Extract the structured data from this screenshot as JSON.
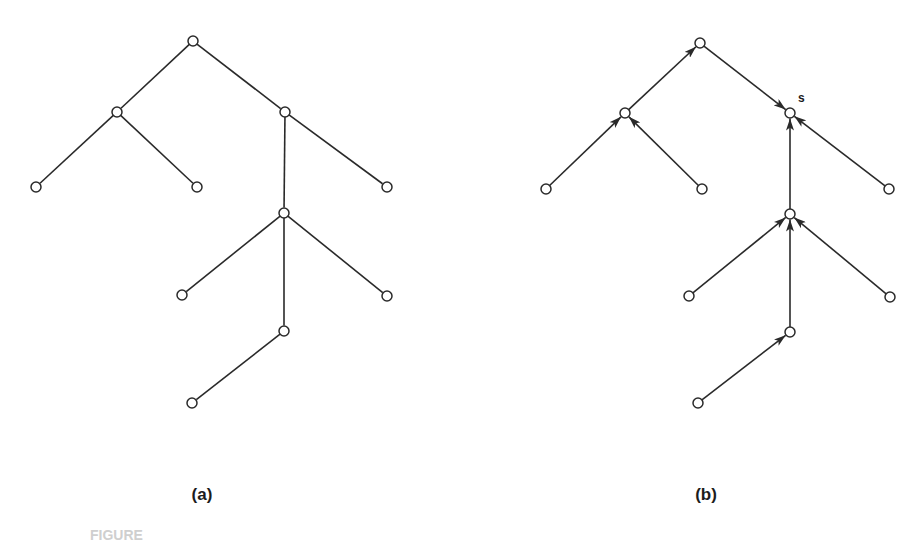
{
  "figure": {
    "panels": [
      {
        "id": "a",
        "label": "(a)",
        "label_pos": [
          202,
          485
        ],
        "directed": false,
        "nodes": [
          {
            "id": "r",
            "x": 193,
            "y": 41
          },
          {
            "id": "L",
            "x": 117,
            "y": 112
          },
          {
            "id": "R",
            "x": 285,
            "y": 112
          },
          {
            "id": "LL",
            "x": 36,
            "y": 187
          },
          {
            "id": "LR",
            "x": 197,
            "y": 187
          },
          {
            "id": "RR",
            "x": 387,
            "y": 187
          },
          {
            "id": "M",
            "x": 284,
            "y": 213
          },
          {
            "id": "ML",
            "x": 182,
            "y": 295
          },
          {
            "id": "MR",
            "x": 387,
            "y": 296
          },
          {
            "id": "D",
            "x": 284,
            "y": 331
          },
          {
            "id": "DL",
            "x": 192,
            "y": 403
          }
        ],
        "edges": [
          [
            "r",
            "L"
          ],
          [
            "r",
            "R"
          ],
          [
            "L",
            "LL"
          ],
          [
            "L",
            "LR"
          ],
          [
            "R",
            "RR"
          ],
          [
            "R",
            "M"
          ],
          [
            "M",
            "ML"
          ],
          [
            "M",
            "MR"
          ],
          [
            "M",
            "D"
          ],
          [
            "D",
            "DL"
          ]
        ]
      },
      {
        "id": "b",
        "label": "(b)",
        "label_pos": [
          706,
          485
        ],
        "directed": true,
        "special_node": {
          "id": "S",
          "label": "s",
          "label_offset": [
            12,
            -16
          ]
        },
        "nodes": [
          {
            "id": "r",
            "x": 700,
            "y": 43
          },
          {
            "id": "L",
            "x": 625,
            "y": 113
          },
          {
            "id": "S",
            "x": 790,
            "y": 113
          },
          {
            "id": "LL",
            "x": 546,
            "y": 189
          },
          {
            "id": "LR",
            "x": 702,
            "y": 189
          },
          {
            "id": "RR",
            "x": 889,
            "y": 189
          },
          {
            "id": "M",
            "x": 790,
            "y": 214
          },
          {
            "id": "ML",
            "x": 689,
            "y": 296
          },
          {
            "id": "MR",
            "x": 890,
            "y": 297
          },
          {
            "id": "D",
            "x": 790,
            "y": 332
          },
          {
            "id": "DL",
            "x": 698,
            "y": 403
          }
        ],
        "edges": [
          [
            "LL",
            "L"
          ],
          [
            "LR",
            "L"
          ],
          [
            "L",
            "r"
          ],
          [
            "r",
            "S"
          ],
          [
            "RR",
            "S"
          ],
          [
            "M",
            "S"
          ],
          [
            "ML",
            "M"
          ],
          [
            "MR",
            "M"
          ],
          [
            "D",
            "M"
          ],
          [
            "DL",
            "D"
          ]
        ]
      }
    ],
    "caption_fragment": "FIGURE"
  }
}
